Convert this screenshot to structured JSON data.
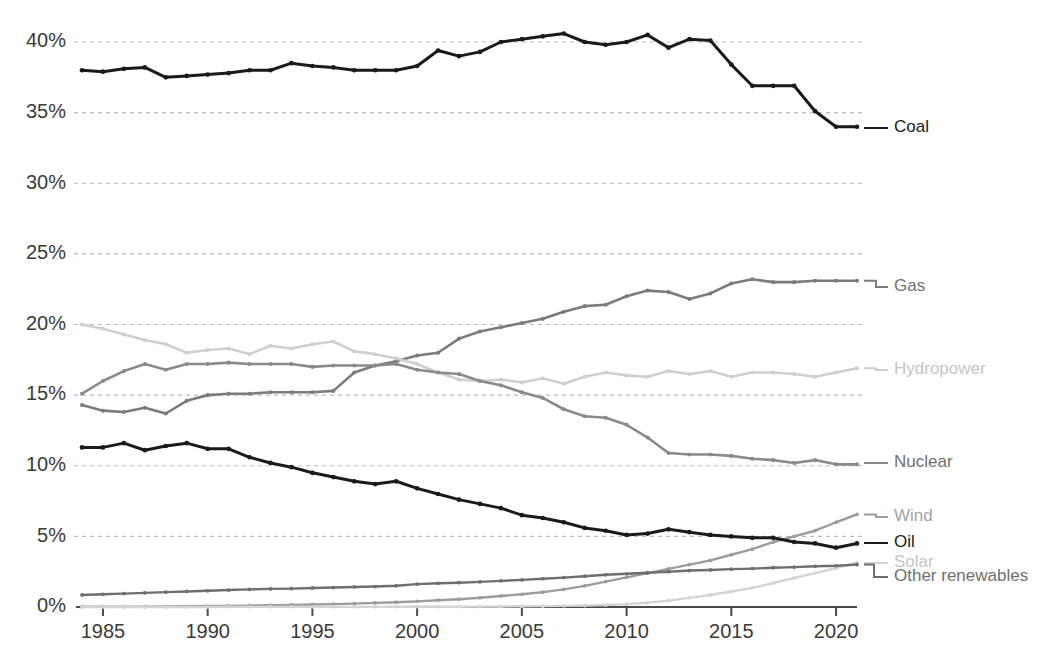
{
  "chart_data": {
    "type": "line",
    "title": "",
    "subtitle": "",
    "xlabel": "",
    "ylabel": "",
    "xlim": [
      1984,
      2021
    ],
    "ylim": [
      0,
      41.5
    ],
    "grid": true,
    "grid_axis": "y",
    "legend_position": "right-inline",
    "y_tick_labels": [
      "0%",
      "5%",
      "10%",
      "15%",
      "20%",
      "25%",
      "30%",
      "35%",
      "40%"
    ],
    "y_ticks": [
      0,
      5,
      10,
      15,
      20,
      25,
      30,
      35,
      40
    ],
    "x_tick_labels": [
      "1985",
      "1990",
      "1995",
      "2000",
      "2005",
      "2010",
      "2015",
      "2020"
    ],
    "x_ticks": [
      1985,
      1990,
      1995,
      2000,
      2005,
      2010,
      2015,
      2020
    ],
    "x": [
      1984,
      1985,
      1986,
      1987,
      1988,
      1989,
      1990,
      1991,
      1992,
      1993,
      1994,
      1995,
      1996,
      1997,
      1998,
      1999,
      2000,
      2001,
      2002,
      2003,
      2004,
      2005,
      2006,
      2007,
      2008,
      2009,
      2010,
      2011,
      2012,
      2013,
      2014,
      2015,
      2016,
      2017,
      2018,
      2019,
      2020,
      2021
    ],
    "series": [
      {
        "name": "Coal",
        "color": "#1a1a1a",
        "label_color": "#1a1a1a",
        "values": [
          38.0,
          37.9,
          38.1,
          38.2,
          37.5,
          37.6,
          37.7,
          37.8,
          38.0,
          38.0,
          38.5,
          38.3,
          38.2,
          38.0,
          38.0,
          38.0,
          38.3,
          39.4,
          39.0,
          39.3,
          40.0,
          40.2,
          40.4,
          40.6,
          40.0,
          39.8,
          40.0,
          40.5,
          39.6,
          40.2,
          40.1,
          38.4,
          36.9,
          36.9,
          36.9,
          35.1,
          34.0,
          34.0
        ]
      },
      {
        "name": "Gas",
        "color": "#7b7b7b",
        "label_color": "#6f6f6f",
        "values": [
          14.3,
          13.9,
          13.8,
          14.1,
          13.7,
          14.6,
          15.0,
          15.1,
          15.1,
          15.2,
          15.2,
          15.2,
          15.3,
          16.6,
          17.1,
          17.4,
          17.8,
          18.0,
          19.0,
          19.5,
          19.8,
          20.1,
          20.4,
          20.9,
          21.3,
          21.4,
          22.0,
          22.4,
          22.3,
          21.8,
          22.2,
          22.9,
          23.2,
          23.0,
          23.0,
          23.1,
          23.1,
          23.1
        ]
      },
      {
        "name": "Hydropower",
        "color": "#cfcfcf",
        "label_color": "#c5c5c5",
        "values": [
          20.0,
          19.7,
          19.3,
          18.9,
          18.6,
          18.0,
          18.2,
          18.3,
          17.9,
          18.5,
          18.3,
          18.6,
          18.8,
          18.1,
          17.9,
          17.6,
          17.2,
          16.6,
          16.1,
          16.0,
          16.1,
          15.9,
          16.2,
          15.8,
          16.3,
          16.6,
          16.4,
          16.3,
          16.7,
          16.5,
          16.7,
          16.3,
          16.6,
          16.6,
          16.5,
          16.3,
          16.6,
          16.9
        ]
      },
      {
        "name": "Nuclear",
        "color": "#8a8a8a",
        "label_color": "#6f6f6f",
        "values": [
          15.1,
          16.0,
          16.7,
          17.2,
          16.8,
          17.2,
          17.2,
          17.3,
          17.2,
          17.2,
          17.2,
          17.0,
          17.1,
          17.1,
          17.1,
          17.2,
          16.8,
          16.6,
          16.5,
          16.0,
          15.7,
          15.2,
          14.8,
          14.0,
          13.5,
          13.4,
          12.9,
          12.0,
          10.9,
          10.8,
          10.8,
          10.7,
          10.5,
          10.4,
          10.2,
          10.4,
          10.1,
          10.1
        ]
      },
      {
        "name": "Wind",
        "color": "#9c9c9c",
        "label_color": "#a3a3a3",
        "values": [
          0.02,
          0.02,
          0.03,
          0.03,
          0.04,
          0.05,
          0.07,
          0.08,
          0.1,
          0.12,
          0.15,
          0.18,
          0.2,
          0.24,
          0.29,
          0.34,
          0.4,
          0.48,
          0.55,
          0.65,
          0.78,
          0.9,
          1.05,
          1.25,
          1.5,
          1.8,
          2.1,
          2.4,
          2.7,
          3.0,
          3.3,
          3.7,
          4.1,
          4.6,
          5.0,
          5.4,
          6.0,
          6.55
        ]
      },
      {
        "name": "Oil",
        "color": "#1a1a1a",
        "label_color": "#1a1a1a",
        "values": [
          11.3,
          11.3,
          11.6,
          11.1,
          11.4,
          11.6,
          11.2,
          11.2,
          10.6,
          10.2,
          9.9,
          9.5,
          9.2,
          8.9,
          8.7,
          8.9,
          8.4,
          8.0,
          7.6,
          7.3,
          7.0,
          6.5,
          6.3,
          6.0,
          5.6,
          5.4,
          5.1,
          5.2,
          5.5,
          5.3,
          5.1,
          5.0,
          4.9,
          4.9,
          4.6,
          4.5,
          4.2,
          4.5
        ]
      },
      {
        "name": "Solar",
        "color": "#d4d4d4",
        "label_color": "#c5c5c5",
        "values": [
          0.0,
          0.0,
          0.0,
          0.0,
          0.0,
          0.0,
          0.0,
          0.01,
          0.01,
          0.01,
          0.01,
          0.01,
          0.01,
          0.01,
          0.01,
          0.02,
          0.02,
          0.02,
          0.02,
          0.03,
          0.04,
          0.05,
          0.06,
          0.08,
          0.1,
          0.14,
          0.2,
          0.3,
          0.45,
          0.65,
          0.85,
          1.1,
          1.35,
          1.7,
          2.05,
          2.4,
          2.75,
          3.15
        ]
      },
      {
        "name": "Other renewables",
        "color": "#6e6e6e",
        "label_color": "#6f6f6f",
        "values": [
          0.85,
          0.9,
          0.95,
          1.0,
          1.05,
          1.1,
          1.15,
          1.2,
          1.25,
          1.28,
          1.3,
          1.35,
          1.38,
          1.42,
          1.45,
          1.5,
          1.62,
          1.68,
          1.72,
          1.78,
          1.85,
          1.92,
          2.0,
          2.08,
          2.18,
          2.28,
          2.35,
          2.42,
          2.5,
          2.58,
          2.62,
          2.68,
          2.72,
          2.78,
          2.82,
          2.88,
          2.92,
          3.0
        ]
      }
    ],
    "legend": [
      {
        "name": "Coal",
        "label": "Coal"
      },
      {
        "name": "Gas",
        "label": "Gas"
      },
      {
        "name": "Hydropower",
        "label": "Hydropower"
      },
      {
        "name": "Nuclear",
        "label": "Nuclear"
      },
      {
        "name": "Wind",
        "label": "Wind"
      },
      {
        "name": "Oil",
        "label": "Oil"
      },
      {
        "name": "Solar",
        "label": "Solar"
      },
      {
        "name": "Other renewables",
        "label": "Other renewables"
      }
    ]
  }
}
